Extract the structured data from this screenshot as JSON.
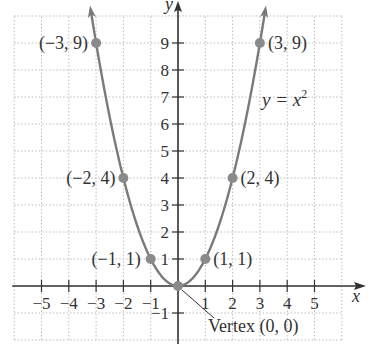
{
  "chart_data": {
    "type": "line",
    "title": "",
    "equation_label": "y = x²",
    "equation_parts": {
      "lhs": "y = x",
      "exp": "2"
    },
    "xlabel": "x",
    "ylabel": "y",
    "xlim": [
      -6,
      6
    ],
    "ylim": [
      -2,
      10
    ],
    "grid": true,
    "x_ticks": [
      -5,
      -4,
      -3,
      -2,
      -1,
      1,
      2,
      3,
      4,
      5
    ],
    "x_tick_labels": [
      "−5",
      "−4",
      "−3",
      "−2",
      "−1",
      "1",
      "2",
      "3",
      "4",
      "5"
    ],
    "y_ticks": [
      -1,
      1,
      2,
      3,
      4,
      5,
      6,
      7,
      8,
      9
    ],
    "y_tick_labels": [
      "−1",
      "1",
      "2",
      "3",
      "4",
      "5",
      "6",
      "7",
      "8",
      "9"
    ],
    "series": [
      {
        "name": "y = x^2",
        "function": "x^2",
        "x_range": [
          -3.2,
          3.2
        ],
        "color": "#7a7a7a"
      }
    ],
    "points": [
      {
        "x": -3,
        "y": 9,
        "label": "(−3, 9)"
      },
      {
        "x": -2,
        "y": 4,
        "label": "(−2, 4)"
      },
      {
        "x": -1,
        "y": 1,
        "label": "(−1, 1)"
      },
      {
        "x": 0,
        "y": 0,
        "label": ""
      },
      {
        "x": 1,
        "y": 1,
        "label": "(1, 1)"
      },
      {
        "x": 2,
        "y": 4,
        "label": "(2, 4)"
      },
      {
        "x": 3,
        "y": 9,
        "label": "(3, 9)"
      }
    ],
    "annotations": [
      {
        "text": "Vertex (0, 0)",
        "points_to": {
          "x": 0,
          "y": 0
        }
      }
    ]
  },
  "colors": {
    "curve": "#7a7a7a",
    "axis": "#333333",
    "grid": "#bdbdbd",
    "text": "#333333"
  }
}
